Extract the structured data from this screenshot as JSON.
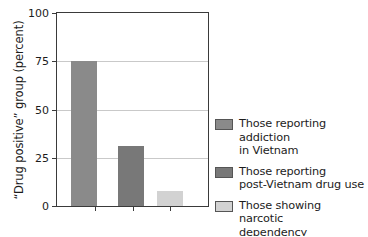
{
  "chart_data": {
    "type": "bar",
    "title": "",
    "xlabel": "",
    "ylabel": "“Drug positive” group (percent)",
    "categories": [
      "Those reporting addiction in Vietnam",
      "Those reporting post-Vietnam drug use",
      "Those showing narcotic dependency"
    ],
    "values": [
      75,
      31,
      8
    ],
    "ylim": [
      0,
      100
    ],
    "yticks": [
      0,
      25,
      50,
      75,
      100
    ],
    "ytick_labels": [
      "0",
      "25",
      "50",
      "75",
      "100"
    ],
    "grid": true,
    "grid_axis": "y",
    "legend_position": "right",
    "bar_colors": [
      "#8a8a8a",
      "#787878",
      "#d2d2d2"
    ],
    "series": [
      {
        "name": "Those reporting addiction in Vietnam",
        "value": 75,
        "color": "#8a8a8a"
      },
      {
        "name": "Those reporting post-Vietnam drug use",
        "value": 31,
        "color": "#787878"
      },
      {
        "name": "Those showing narcotic dependency",
        "value": 8,
        "color": "#d2d2d2"
      }
    ]
  },
  "axis": {
    "y_title": "“Drug positive” group (percent)",
    "tick_100": "100",
    "tick_75": "75",
    "tick_50": "50",
    "tick_25": "25",
    "tick_0": "0"
  },
  "legend": {
    "items": [
      {
        "line1": "Those reporting addiction",
        "line2": "in Vietnam",
        "color": "#8a8a8a"
      },
      {
        "line1": "Those reporting",
        "line2": "post-Vietnam drug use",
        "color": "#787878"
      },
      {
        "line1": "Those showing narcotic",
        "line2": "dependency",
        "color": "#d2d2d2"
      }
    ]
  },
  "colors": {
    "frame": "#3a3a3a",
    "grid": "#c9c9c9",
    "text": "#1c1c1c",
    "background": "#ffffff"
  }
}
